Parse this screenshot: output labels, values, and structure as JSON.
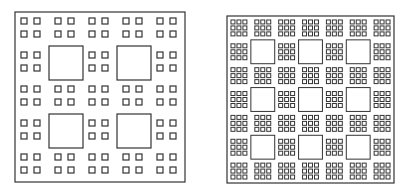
{
  "figures": [
    {
      "id": "left-fractal",
      "description": "Carpet fractal, 5x5 grid, 2x2 small squares per cell, large squares at odd cells",
      "x": 15,
      "y": 12,
      "size": 170,
      "grid": 5,
      "sub_grid": 2,
      "sub_offsets": [
        6,
        19
      ],
      "sub_size": 6,
      "large_cells": [
        [
          1,
          1
        ],
        [
          1,
          3
        ],
        [
          3,
          1
        ],
        [
          3,
          3
        ]
      ],
      "stroke": "#333333",
      "outer_stroke_width": 1.2,
      "inner_stroke_width": 1.2
    },
    {
      "id": "right-fractal",
      "description": "Carpet fractal, 7x7 grid, 3x3 small squares per cell, large squares at odd cells",
      "x": 227,
      "y": 16,
      "size": 167,
      "grid": 7,
      "sub_grid": 3,
      "sub_offsets": [
        4,
        10,
        16
      ],
      "sub_size": 4,
      "large_cells": [
        [
          1,
          1
        ],
        [
          1,
          3
        ],
        [
          1,
          5
        ],
        [
          3,
          1
        ],
        [
          3,
          3
        ],
        [
          3,
          5
        ],
        [
          5,
          1
        ],
        [
          5,
          3
        ],
        [
          5,
          5
        ]
      ],
      "stroke": "#333333",
      "outer_stroke_width": 1.2,
      "inner_stroke_width": 1.0
    }
  ],
  "background": "#ffffff"
}
